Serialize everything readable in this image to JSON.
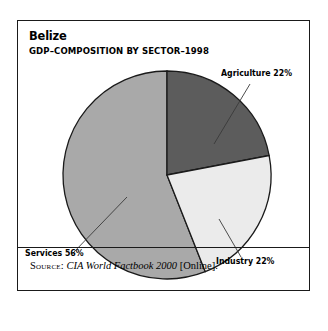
{
  "figure": {
    "title": "Belize",
    "subtitle": "GDP–COMPOSITION BY SECTOR–1998",
    "source": {
      "label": "Source:",
      "title": "CIA World Factbook 2000",
      "suffix": "[Online]."
    },
    "border_color": "#1a1a1a",
    "background": "#ffffff"
  },
  "labels": {
    "agriculture": "Agriculture 22%",
    "industry": "Industry 22%",
    "services": "Services 56%"
  },
  "chart_data": {
    "type": "pie",
    "title": "Belize",
    "subtitle": "GDP–COMPOSITION BY SECTOR–1998",
    "xlabel": "",
    "ylabel": "",
    "categories": [
      "Agriculture",
      "Industry",
      "Services"
    ],
    "values": [
      22,
      22,
      56
    ],
    "units": "percent",
    "value_labels": [
      "Agriculture 22%",
      "Industry 22%",
      "Services 56%"
    ],
    "colors": [
      "#5c5c5c",
      "#ebebeb",
      "#a9a9a9"
    ],
    "slice_colors": {
      "agriculture": "#5c5c5c",
      "industry": "#ebebeb",
      "services": "#a9a9a9"
    },
    "start_angle_deg": 90,
    "direction": "clockwise",
    "center": [
      166,
      174
    ],
    "radius": 104,
    "legend": "none",
    "grid": false,
    "annotations": [
      {
        "text": "Agriculture 22%",
        "slice": "Agriculture",
        "leader": true
      },
      {
        "text": "Industry 22%",
        "slice": "Industry",
        "leader": true
      },
      {
        "text": "Services 56%",
        "slice": "Services",
        "leader": true
      }
    ],
    "source": "Source: CIA World Factbook 2000 [Online]."
  }
}
